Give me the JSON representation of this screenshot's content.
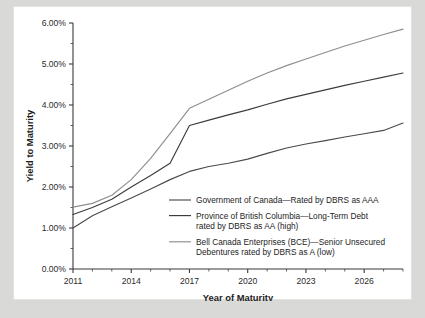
{
  "chart_data": {
    "type": "line",
    "title": "",
    "xlabel": "Year of Maturity",
    "ylabel": "Yield to Maturity",
    "xlim": [
      2011,
      2028
    ],
    "ylim": [
      0,
      6
    ],
    "xticks": [
      2011,
      2014,
      2017,
      2020,
      2023,
      2026
    ],
    "xticklabels": [
      "2011",
      "2014",
      "2017",
      "2020",
      "2023",
      "2026"
    ],
    "x_minor_step": 1,
    "yticks": [
      0,
      1,
      2,
      3,
      4,
      5,
      6
    ],
    "yticklabels": [
      "0.00%",
      "1.00%",
      "2.00%",
      "3.00%",
      "4.00%",
      "5.00%",
      "6.00%"
    ],
    "y_minor_step": 0.5,
    "grid": false,
    "legend_position": "center-lower",
    "series": [
      {
        "name": "Government of Canada—Rated by DBRS as AAA",
        "color": "#4a4a4a",
        "x": [
          2011,
          2012,
          2013,
          2014,
          2015,
          2016,
          2017,
          2018,
          2019,
          2020,
          2021,
          2022,
          2023,
          2024,
          2025,
          2026,
          2027,
          2028
        ],
        "values": [
          1.0,
          1.3,
          1.52,
          1.73,
          1.95,
          2.18,
          2.38,
          2.5,
          2.58,
          2.68,
          2.82,
          2.95,
          3.05,
          3.13,
          3.22,
          3.3,
          3.38,
          3.56
        ]
      },
      {
        "name": "Province of British Columbia—Long-Term Debt rated by DBRS as AA (high)",
        "color": "#3c3c3c",
        "x": [
          2011,
          2012,
          2013,
          2014,
          2015,
          2016,
          2017,
          2018,
          2019,
          2020,
          2021,
          2022,
          2023,
          2024,
          2025,
          2026,
          2027,
          2028
        ],
        "values": [
          1.33,
          1.5,
          1.7,
          2.0,
          2.28,
          2.58,
          3.5,
          3.63,
          3.76,
          3.88,
          4.02,
          4.15,
          4.26,
          4.37,
          4.48,
          4.58,
          4.68,
          4.78
        ]
      },
      {
        "name": "Bell Canada Enterprises (BCE)—Senior Unsecured Debentures rated by DBRS as A (low)",
        "color": "#8e8e8e",
        "x": [
          2011,
          2012,
          2013,
          2014,
          2015,
          2016,
          2017,
          2018,
          2019,
          2020,
          2021,
          2022,
          2023,
          2024,
          2025,
          2026,
          2027,
          2028
        ],
        "values": [
          1.51,
          1.6,
          1.8,
          2.18,
          2.7,
          3.3,
          3.92,
          4.14,
          4.36,
          4.58,
          4.78,
          4.96,
          5.12,
          5.28,
          5.44,
          5.58,
          5.72,
          5.85
        ]
      }
    ],
    "legend_entries": [
      {
        "lines": [
          "Government of Canada—Rated by DBRS as AAA"
        ],
        "color": "#4a4a4a"
      },
      {
        "lines": [
          "Province of British Columbia—Long-Term Debt",
          "rated by DBRS as AA (high)"
        ],
        "color": "#3c3c3c"
      },
      {
        "lines": [
          "Bell Canada Enterprises (BCE)—Senior Unsecured",
          "Debentures rated by DBRS as A (low)"
        ],
        "color": "#8e8e8e"
      }
    ]
  },
  "colors": {
    "page_background": "#d9d9d7",
    "panel_background": "#ffffff",
    "axis": "#3a3a3a",
    "text": "#1d1d1d"
  }
}
